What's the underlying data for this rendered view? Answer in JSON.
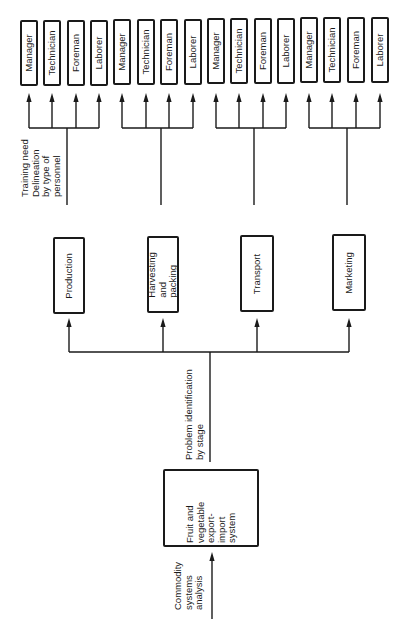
{
  "root": {
    "label": "Fruit and vegetable export-import system",
    "lines": [
      "Fruit and",
      "vegetable",
      "export-",
      "import",
      "system"
    ]
  },
  "annotations": {
    "input": "Commodity\nsystems\nanalysis",
    "stage_level": "Problem identification\nby stage",
    "personnel_level": "Training need\nDelineation\nby type of\npersonnel"
  },
  "stages": [
    {
      "label": "Production"
    },
    {
      "label": "Harvesting\nand packing"
    },
    {
      "label": "Transport"
    },
    {
      "label": "Marketing"
    }
  ],
  "personnel_types": [
    "Manager",
    "Technician",
    "Foreman",
    "Laborer"
  ],
  "personnel_groups": [
    {
      "stage": "Production",
      "roles": [
        "Manager",
        "Technician",
        "Foreman",
        "Laborer"
      ]
    },
    {
      "stage": "Harvesting and packing",
      "roles": [
        "Manager",
        "Technician",
        "Foreman",
        "Laborer"
      ]
    },
    {
      "stage": "Transport",
      "roles": [
        "Manager",
        "Technician",
        "Foreman",
        "Laborer"
      ]
    },
    {
      "stage": "Marketing",
      "roles": [
        "Manager",
        "Technician",
        "Foreman",
        "Laborer"
      ]
    }
  ],
  "colors": {
    "stroke": "#1a1a1a",
    "background": "#ffffff"
  }
}
